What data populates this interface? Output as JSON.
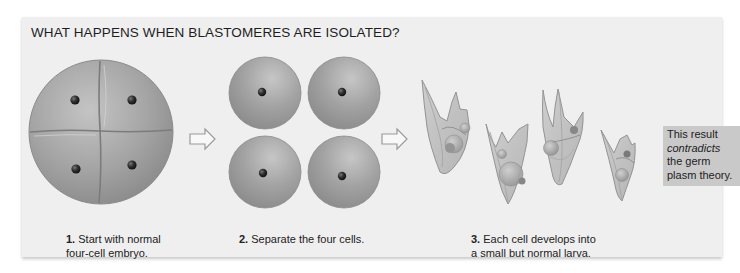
{
  "figure": {
    "title": "WHAT HAPPENS WHEN BLASTOMERES ARE ISOLATED?",
    "steps": [
      {
        "number": "1.",
        "text_line1": "Start with normal",
        "text_line2": "four-cell embryo."
      },
      {
        "number": "2.",
        "text_line1": "Separate the four cells.",
        "text_line2": ""
      },
      {
        "number": "3.",
        "text_line1": "Each cell develops into",
        "text_line2": "a small but normal larva."
      }
    ],
    "note": {
      "line1": "This result",
      "emphasis": "contradicts",
      "line3": "the germ",
      "line4": "plasm theory."
    },
    "colors": {
      "panel_bg": "#efefef",
      "cell_fill": "#9a9a9a",
      "cell_highlight": "#c8c8c8",
      "nucleus": "#2a2a2a",
      "arrow_stroke": "#9a9a9a",
      "note_bg": "#c9c9c9"
    }
  }
}
